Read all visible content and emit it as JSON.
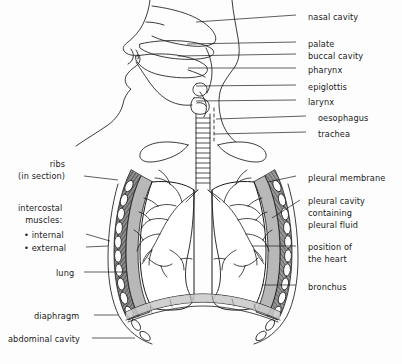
{
  "diagram": {
    "type": "labelled-anatomical-diagram",
    "background_color": "#fdfdfd",
    "ink_color": "#1a1a1a",
    "muscle_fill": "#8d8d8d",
    "pleura_fill": "#b8b8b8",
    "bone_fill": "#ffffff"
  },
  "labels_right": [
    {
      "id": "nasal-cavity",
      "text": "nasal cavity",
      "x": 308,
      "y": 11,
      "leader": {
        "x1": 296,
        "y1": 15,
        "x2": 196,
        "y2": 22
      }
    },
    {
      "id": "palate",
      "text": "palate",
      "x": 308,
      "y": 38,
      "leader": {
        "x1": 296,
        "y1": 42,
        "x2": 187,
        "y2": 44
      }
    },
    {
      "id": "buccal-cavity",
      "text": "buccal cavity",
      "x": 308,
      "y": 50,
      "leader": {
        "x1": 296,
        "y1": 54,
        "x2": 178,
        "y2": 56
      }
    },
    {
      "id": "pharynx",
      "text": "pharynx",
      "x": 308,
      "y": 64,
      "leader": {
        "x1": 296,
        "y1": 68,
        "x2": 188,
        "y2": 68
      }
    },
    {
      "id": "epiglottis",
      "text": "epiglottis",
      "x": 308,
      "y": 81,
      "leader": {
        "x1": 296,
        "y1": 85,
        "x2": 196,
        "y2": 86
      }
    },
    {
      "id": "larynx",
      "text": "larynx",
      "x": 308,
      "y": 96,
      "leader": {
        "x1": 296,
        "y1": 100,
        "x2": 196,
        "y2": 101
      }
    },
    {
      "id": "oesophagus",
      "text": "oesophagus",
      "x": 318,
      "y": 112,
      "leader": {
        "x1": 306,
        "y1": 116,
        "x2": 216,
        "y2": 119
      }
    },
    {
      "id": "trachea",
      "text": "trachea",
      "x": 318,
      "y": 128,
      "leader": {
        "x1": 306,
        "y1": 132,
        "x2": 214,
        "y2": 134
      }
    }
  ],
  "labels_right_lower": [
    {
      "id": "pleural-membrane",
      "lines": [
        "pleural membrane"
      ],
      "x": 308,
      "y": 172,
      "leader": {
        "x1": 296,
        "y1": 176,
        "x2": 268,
        "y2": 182
      }
    },
    {
      "id": "pleural-cavity",
      "lines": [
        "pleural cavity",
        "containing",
        "pleural fluid"
      ],
      "x": 308,
      "y": 195,
      "leader": {
        "x1": 300,
        "y1": 200,
        "x2": 272,
        "y2": 218
      }
    },
    {
      "id": "position-of-heart",
      "lines": [
        "position of",
        "the heart"
      ],
      "x": 308,
      "y": 241,
      "leader": {
        "x1": 296,
        "y1": 246,
        "x2": 252,
        "y2": 246
      }
    },
    {
      "id": "bronchus",
      "lines": [
        "bronchus"
      ],
      "x": 308,
      "y": 281,
      "leader": {
        "x1": 296,
        "y1": 285,
        "x2": 262,
        "y2": 285
      }
    }
  ],
  "labels_left": [
    {
      "id": "ribs",
      "lines": [
        "ribs",
        "(in section)"
      ],
      "x": 18,
      "y": 158,
      "align": "left",
      "leader": {
        "x1": 84,
        "y1": 176,
        "x2": 118,
        "y2": 180
      }
    },
    {
      "id": "intercostal-muscles",
      "lines": [
        "intercostal",
        "muscles:"
      ],
      "x": 18,
      "y": 202,
      "align": "left",
      "leader": null
    },
    {
      "id": "intercostal-internal",
      "lines": [
        "• internal"
      ],
      "x": 24,
      "y": 229,
      "align": "left",
      "leader": {
        "x1": 86,
        "y1": 234,
        "x2": 110,
        "y2": 241
      }
    },
    {
      "id": "intercostal-external",
      "lines": [
        "• external"
      ],
      "x": 24,
      "y": 242,
      "align": "left",
      "leader": {
        "x1": 86,
        "y1": 247,
        "x2": 108,
        "y2": 246
      }
    },
    {
      "id": "lung",
      "lines": [
        "lung"
      ],
      "x": 56,
      "y": 267,
      "align": "left",
      "leader": {
        "x1": 84,
        "y1": 272,
        "x2": 127,
        "y2": 272
      }
    },
    {
      "id": "diaphragm",
      "lines": [
        "diaphragm"
      ],
      "x": 34,
      "y": 310,
      "align": "left",
      "leader": {
        "x1": 94,
        "y1": 315,
        "x2": 118,
        "y2": 315
      }
    },
    {
      "id": "abdominal-cavity",
      "lines": [
        "abdominal cavity"
      ],
      "x": 8,
      "y": 333,
      "align": "left",
      "leader": {
        "x1": 92,
        "y1": 338,
        "x2": 135,
        "y2": 338
      }
    }
  ]
}
